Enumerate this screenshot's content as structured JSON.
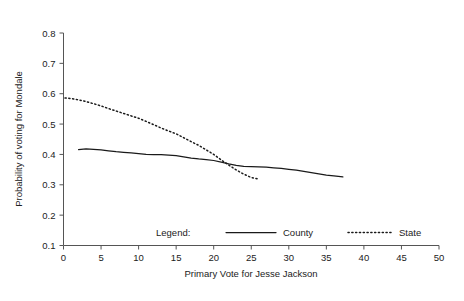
{
  "chart_data": {
    "type": "line",
    "title": "",
    "xlabel": "Primary Vote for Jesse Jackson",
    "ylabel": "Probability of voting for Mondale",
    "xlim": [
      0,
      50
    ],
    "ylim": [
      0.1,
      0.8
    ],
    "xticks": [
      0,
      5,
      10,
      15,
      20,
      25,
      30,
      35,
      40,
      45,
      50
    ],
    "xtick_labels": [
      "0",
      "5",
      "10",
      "15",
      "20",
      "25",
      "30",
      "35",
      "40",
      "45",
      "50"
    ],
    "yticks": [
      0.1,
      0.2,
      0.3,
      0.4,
      0.5,
      0.6,
      0.7,
      0.8
    ],
    "ytick_labels": [
      "0.1",
      "0.2",
      "0.3",
      "0.4",
      "0.5",
      "0.6",
      "0.7",
      "0.8"
    ],
    "grid": false,
    "legend_position": "inside-bottom",
    "legend_title": "Legend:",
    "series": [
      {
        "name": "County",
        "style": "solid",
        "color": "#1a1a1a",
        "points": [
          [
            2.0,
            0.416
          ],
          [
            3.0,
            0.418
          ],
          [
            4.0,
            0.417
          ],
          [
            5.0,
            0.415
          ],
          [
            6.0,
            0.412
          ],
          [
            7.0,
            0.409
          ],
          [
            8.0,
            0.407
          ],
          [
            9.0,
            0.405
          ],
          [
            10.0,
            0.403
          ],
          [
            11.0,
            0.4
          ],
          [
            12.0,
            0.399
          ],
          [
            13.0,
            0.399
          ],
          [
            14.0,
            0.398
          ],
          [
            15.0,
            0.396
          ],
          [
            16.0,
            0.392
          ],
          [
            17.0,
            0.388
          ],
          [
            18.0,
            0.385
          ],
          [
            19.0,
            0.383
          ],
          [
            20.0,
            0.38
          ],
          [
            21.0,
            0.375
          ],
          [
            22.0,
            0.369
          ],
          [
            23.0,
            0.364
          ],
          [
            24.0,
            0.361
          ],
          [
            25.0,
            0.36
          ],
          [
            26.0,
            0.359
          ],
          [
            27.0,
            0.358
          ],
          [
            28.0,
            0.356
          ],
          [
            29.0,
            0.354
          ],
          [
            30.0,
            0.351
          ],
          [
            31.0,
            0.348
          ],
          [
            32.0,
            0.344
          ],
          [
            33.0,
            0.34
          ],
          [
            34.0,
            0.336
          ],
          [
            35.0,
            0.332
          ],
          [
            36.0,
            0.329
          ],
          [
            37.2,
            0.326
          ]
        ]
      },
      {
        "name": "State",
        "style": "dotted",
        "color": "#1a1a1a",
        "points": [
          [
            0.2,
            0.586
          ],
          [
            1.0,
            0.584
          ],
          [
            2.0,
            0.58
          ],
          [
            3.0,
            0.574
          ],
          [
            4.0,
            0.567
          ],
          [
            5.0,
            0.56
          ],
          [
            6.0,
            0.551
          ],
          [
            7.0,
            0.543
          ],
          [
            8.0,
            0.535
          ],
          [
            9.0,
            0.527
          ],
          [
            10.0,
            0.519
          ],
          [
            11.0,
            0.509
          ],
          [
            12.0,
            0.498
          ],
          [
            13.0,
            0.487
          ],
          [
            14.0,
            0.477
          ],
          [
            15.0,
            0.468
          ],
          [
            16.0,
            0.455
          ],
          [
            17.0,
            0.442
          ],
          [
            18.0,
            0.43
          ],
          [
            19.0,
            0.415
          ],
          [
            20.0,
            0.4
          ],
          [
            21.0,
            0.382
          ],
          [
            22.0,
            0.365
          ],
          [
            23.0,
            0.349
          ],
          [
            24.0,
            0.335
          ],
          [
            25.0,
            0.324
          ],
          [
            25.8,
            0.32
          ]
        ]
      }
    ]
  },
  "legend": {
    "label": "Legend:",
    "entries": [
      {
        "name": "County",
        "style": "solid"
      },
      {
        "name": "State",
        "style": "dotted"
      }
    ]
  }
}
